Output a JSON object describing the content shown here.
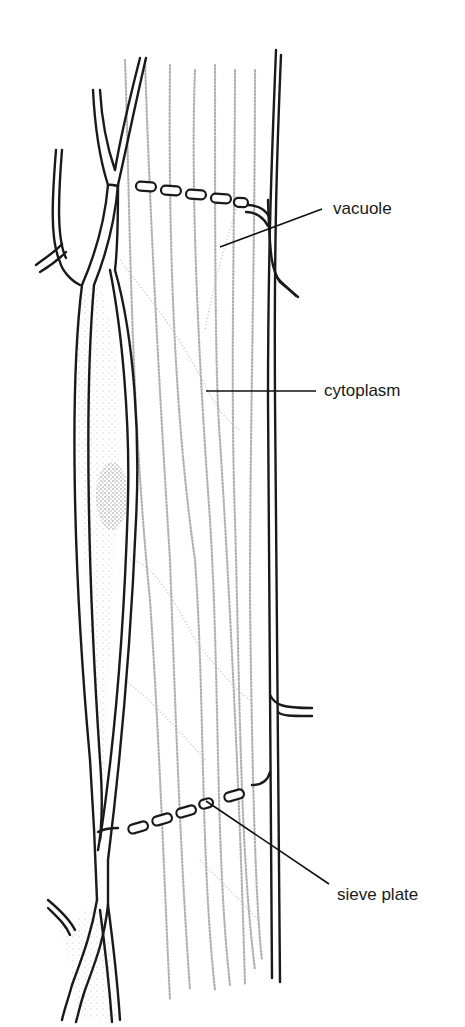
{
  "diagram": {
    "labels": [
      {
        "id": "vacuole",
        "text": "vacuole",
        "x": 333,
        "y": 214,
        "leader": {
          "x1": 220,
          "y1": 247,
          "x2": 322,
          "y2": 209
        }
      },
      {
        "id": "cytoplasm",
        "text": "cytoplasm",
        "x": 324,
        "y": 391,
        "leader": {
          "x1": 206,
          "y1": 391,
          "x2": 316,
          "y2": 391
        }
      },
      {
        "id": "sieve-plate",
        "text": "sieve plate",
        "x": 337,
        "y": 896,
        "leader": {
          "x1": 213,
          "y1": 802,
          "x2": 329,
          "y2": 884
        }
      }
    ],
    "colors": {
      "wall": "#1a1a1a",
      "cytoplasm_stipple": "#b0b0b0",
      "background": "#ffffff",
      "label": "#1a1a1a"
    }
  }
}
